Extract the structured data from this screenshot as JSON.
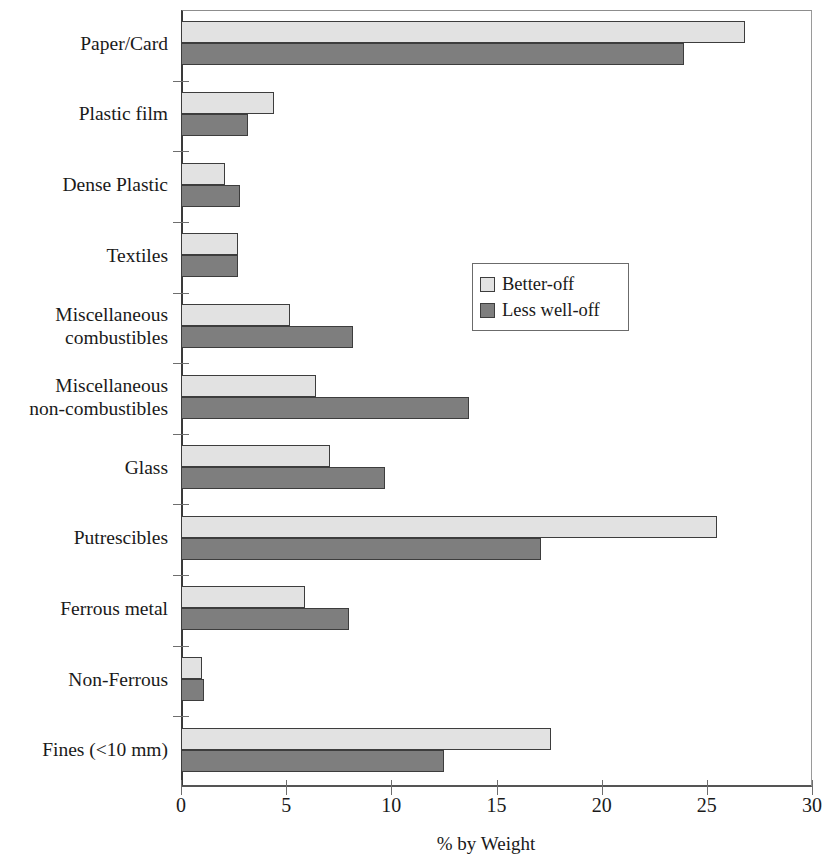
{
  "chart_data": {
    "type": "bar",
    "orientation": "horizontal",
    "title": "",
    "xlabel": "% by Weight",
    "ylabel": "",
    "xlim": [
      0,
      30
    ],
    "xticks": [
      0,
      5,
      10,
      15,
      20,
      25,
      30
    ],
    "grid": false,
    "legend_position": "center-right",
    "categories": [
      "Paper/Card",
      "Plastic film",
      "Dense Plastic",
      "Textiles",
      "Miscellaneous\ncombustibles",
      "Miscellaneous\nnon-combustibles",
      "Glass",
      "Putrescibles",
      "Ferrous metal",
      "Non-Ferrous",
      "Fines (<10 mm)"
    ],
    "series": [
      {
        "name": "Better-off",
        "color": "#e2e2e2",
        "values": [
          26.8,
          4.4,
          2.1,
          2.7,
          5.2,
          6.4,
          7.1,
          25.5,
          5.9,
          1.0,
          17.6
        ]
      },
      {
        "name": "Less well-off",
        "color": "#7e7e7e",
        "values": [
          23.9,
          3.2,
          2.8,
          2.7,
          8.2,
          13.7,
          9.7,
          17.1,
          8.0,
          1.1,
          12.5
        ]
      }
    ]
  },
  "legend": {
    "entries": [
      {
        "label": "Better-off"
      },
      {
        "label": "Less well-off"
      }
    ]
  }
}
